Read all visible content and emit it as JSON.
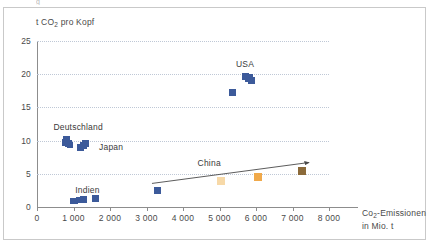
{
  "figure": {
    "frame_border_color": "#c9c9c9",
    "background": "#ffffff",
    "clipped_top_text": "g"
  },
  "axes": {
    "y_title": "t CO",
    "y_title_sub": "2",
    "y_title_rest": " pro Kopf",
    "x_title_line1": "Co",
    "x_title_sub": "2",
    "x_title_line1_rest": "-Emissionen",
    "x_title_line2": "in Mio. t",
    "y_ticks": [
      "0",
      "5",
      "10",
      "15",
      "20",
      "25"
    ],
    "x_ticks": [
      "0",
      "1 000",
      "2 000",
      "3 000",
      "4 000",
      "5 000",
      "6 000",
      "7 000",
      "8 000"
    ],
    "axis_color": "#8d8d8d",
    "grid_color": "#bfc8d6",
    "tick_text_color": "#4a4a4a"
  },
  "chart_data": {
    "type": "scatter",
    "title": "",
    "subtitle": "",
    "xlabel": "Co2-Emissionen in Mio. t",
    "ylabel": "t CO2 pro Kopf",
    "xlim": [
      0,
      8000
    ],
    "ylim": [
      0,
      25
    ],
    "grid": "horizontal-dotted",
    "legend": "inline-annotations",
    "annotations": [
      {
        "text": "Deutschland",
        "x": 450,
        "y": 11.9
      },
      {
        "text": "Japan",
        "x": 1700,
        "y": 8.9
      },
      {
        "text": "USA",
        "x": 5450,
        "y": 21.4
      },
      {
        "text": "China",
        "x": 4400,
        "y": 6.5
      },
      {
        "text": "Indien",
        "x": 1050,
        "y": 2.4
      }
    ],
    "trendline": {
      "x_start": 3150,
      "y_start": 3.55,
      "x_end": 7450,
      "y_end": 6.7,
      "color": "#4a4a4a",
      "arrow": true
    },
    "series": [
      {
        "name": "Deutschland",
        "color": "#3c5a9a",
        "points": [
          {
            "x": 780,
            "y": 9.7,
            "size": 7
          },
          {
            "x": 820,
            "y": 10.1,
            "size": 7
          },
          {
            "x": 870,
            "y": 9.55,
            "size": 7
          },
          {
            "x": 900,
            "y": 9.4,
            "size": 6
          }
        ]
      },
      {
        "name": "Japan",
        "color": "#3c5a9a",
        "points": [
          {
            "x": 1200,
            "y": 8.9,
            "size": 7
          },
          {
            "x": 1280,
            "y": 9.3,
            "size": 7
          },
          {
            "x": 1330,
            "y": 9.6,
            "size": 7
          }
        ]
      },
      {
        "name": "USA",
        "color": "#3c5a9a",
        "points": [
          {
            "x": 5350,
            "y": 17.2,
            "size": 7
          },
          {
            "x": 5700,
            "y": 19.6,
            "size": 7
          },
          {
            "x": 5820,
            "y": 19.5,
            "size": 8
          },
          {
            "x": 5870,
            "y": 19.1,
            "size": 7
          }
        ]
      },
      {
        "name": "Indien",
        "color": "#3c5a9a",
        "points": [
          {
            "x": 980,
            "y": 0.85,
            "size": 6
          },
          {
            "x": 1060,
            "y": 0.9,
            "size": 5
          },
          {
            "x": 1150,
            "y": 1.0,
            "size": 6
          },
          {
            "x": 1280,
            "y": 1.15,
            "size": 7
          },
          {
            "x": 1600,
            "y": 1.3,
            "size": 7
          }
        ]
      },
      {
        "name": "China",
        "color": "#f5b55a",
        "points": [
          {
            "x": 3290,
            "y": 2.5,
            "size": 7,
            "color": "#3c5a9a"
          },
          {
            "x": 5030,
            "y": 3.9,
            "size": 8,
            "color": "#f7d9a8"
          },
          {
            "x": 6060,
            "y": 4.55,
            "size": 8,
            "color": "#f0a94a"
          },
          {
            "x": 7270,
            "y": 5.4,
            "size": 8,
            "color": "#8b6a3a"
          }
        ]
      }
    ]
  }
}
